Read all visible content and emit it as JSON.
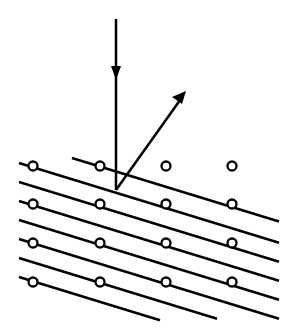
{
  "diagram": {
    "colors": {
      "stroke": "#000000",
      "background": "#ffffff",
      "atom_fill": "#ffffff"
    },
    "lattice": {
      "columns": 4,
      "rows": 5
    },
    "plane_count": 8,
    "elements": [
      "incident-beam",
      "diffracted-beam",
      "lattice-planes",
      "atoms"
    ]
  }
}
